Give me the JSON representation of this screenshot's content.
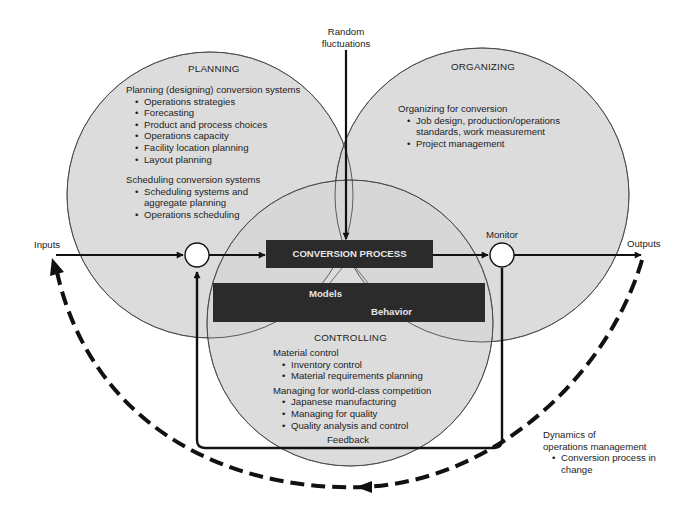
{
  "diagram": {
    "external_labels": {
      "random_fluctuations": [
        "Random",
        "fluctuations"
      ],
      "inputs": "Inputs",
      "outputs": "Outputs",
      "monitor": "Monitor",
      "feedback": "Feedback"
    },
    "planning": {
      "title": "PLANNING",
      "groups": [
        {
          "heading": "Planning (designing) conversion systems",
          "items": [
            "Operations strategies",
            "Forecasting",
            "Product and process choices",
            "Operations capacity",
            "Facility location planning",
            "Layout planning"
          ]
        },
        {
          "heading": "Scheduling conversion systems",
          "items": [
            "Scheduling systems and",
            "aggregate planning",
            "Operations scheduling"
          ]
        }
      ]
    },
    "organizing": {
      "title": "ORGANIZING",
      "groups": [
        {
          "heading": "Organizing for conversion",
          "items": [
            "Job design, production/operations",
            "standards, work measurement",
            "Project management"
          ]
        }
      ]
    },
    "controlling": {
      "title": "CONTROLLING",
      "groups": [
        {
          "heading": "Material control",
          "items": [
            "Inventory control",
            "Material requirements planning"
          ]
        },
        {
          "heading": "Managing for world-class competition",
          "items": [
            "Japanese manufacturing",
            "Managing for quality",
            "Quality analysis and control"
          ]
        }
      ]
    },
    "conversion_process": "CONVERSION PROCESS",
    "models_behavior": {
      "models": "Models",
      "behavior": "Behavior"
    },
    "dynamics": {
      "heading": [
        "Dynamics of",
        "operations management"
      ],
      "items": [
        "Conversion process in",
        "change"
      ]
    },
    "colors": {
      "circle_fill": "#d9d9d9",
      "box_fill": "#2b2b2b",
      "line": "#111111",
      "background": "#ffffff"
    }
  }
}
